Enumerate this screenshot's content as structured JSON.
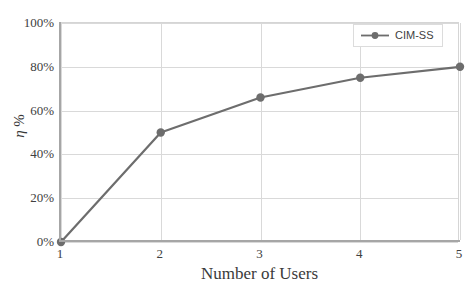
{
  "chart_data": {
    "type": "line",
    "title": "",
    "xlabel": "Number of Users",
    "ylabel": "η %",
    "x": [
      1,
      2,
      3,
      4,
      5
    ],
    "xlim": [
      1,
      5
    ],
    "ylim": [
      0,
      100
    ],
    "grid": true,
    "legend_position": "top-right",
    "xticks": [
      "1",
      "2",
      "3",
      "4",
      "5"
    ],
    "yticks": [
      "0%",
      "20%",
      "40%",
      "60%",
      "80%",
      "100%"
    ],
    "ytick_values": [
      0,
      20,
      40,
      60,
      80,
      100
    ],
    "series": [
      {
        "name": "CIM-SS",
        "color": "#6d6d6d",
        "marker": "circle",
        "values": [
          0,
          50,
          66,
          75,
          80
        ]
      }
    ]
  },
  "legend": {
    "entries": [
      {
        "label": "CIM-SS",
        "color": "#6d6d6d"
      }
    ]
  },
  "axes": {
    "x_title": "Number of Users",
    "y_title_symbol": "η",
    "y_title_unit": "%"
  },
  "colors": {
    "series": "#6d6d6d",
    "grid": "#d9d9d9",
    "axis": "#a6a6a6",
    "frame": "#d5d5d5",
    "text": "#404040",
    "background": "#ffffff"
  }
}
